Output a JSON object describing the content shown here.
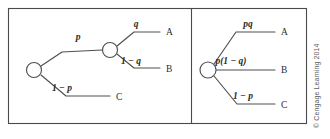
{
  "figure": {
    "credit": "© Cengage Learning 2014"
  },
  "panels": [
    {
      "id": "two-stage-tree",
      "nodes": [
        {
          "id": "root",
          "cx": 34,
          "cy": 70,
          "r": 7.5
        },
        {
          "id": "stage2",
          "cx": 110,
          "cy": 50,
          "r": 7.5
        }
      ],
      "branches": [
        {
          "id": "p-branch",
          "probability": "p",
          "label_x": 78,
          "label_y": 40,
          "outcome": null,
          "outcome_x": null,
          "outcome_y": null,
          "path": "M 41 66 L 62 52 L 102 50"
        },
        {
          "id": "q-branch",
          "probability": "q",
          "label_x": 136,
          "label_y": 27,
          "outcome": "A",
          "outcome_x": 166,
          "outcome_y": 35,
          "path": "M 117 46 L 134 32 L 160 32"
        },
        {
          "id": "one-minus-q-branch",
          "probability": "1 − q",
          "label_x": 131,
          "label_y": 64,
          "outcome": "B",
          "outcome_x": 166,
          "outcome_y": 72,
          "path": "M 117 54 L 134 68 L 160 68"
        },
        {
          "id": "one-minus-p-branch",
          "probability": "1 − p",
          "label_x": 62,
          "label_y": 91,
          "outcome": "C",
          "outcome_x": 116,
          "outcome_y": 100,
          "path": "M 41 75 L 66 96 L 110 96"
        }
      ]
    },
    {
      "id": "collapsed-tree",
      "nodes": [
        {
          "id": "root",
          "cx": 208,
          "cy": 70,
          "r": 8
        }
      ],
      "branches": [
        {
          "id": "pq-branch",
          "probability": "pq",
          "label_x": 248,
          "label_y": 27,
          "outcome": "A",
          "outcome_x": 281,
          "outcome_y": 35,
          "path": "M 214 64 L 236 32 L 275 32"
        },
        {
          "id": "p-one-minus-q-branch",
          "probability": "p(1 − q)",
          "label_x": 231,
          "label_y": 64,
          "outcome": "B",
          "outcome_x": 281,
          "outcome_y": 73,
          "path": "M 216 70 L 275 70"
        },
        {
          "id": "one-minus-p-branch",
          "probability": "1 − p",
          "label_x": 243,
          "label_y": 99,
          "outcome": "C",
          "outcome_x": 281,
          "outcome_y": 108,
          "path": "M 214 76 L 237 104 L 275 104"
        }
      ]
    }
  ]
}
